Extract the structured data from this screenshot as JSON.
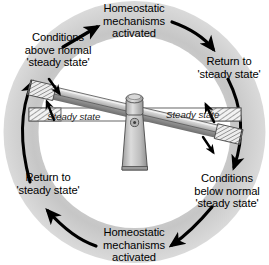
{
  "diagram": {
    "cycle_labels": [
      {
        "id": "homeostatic-top",
        "lines": [
          "Homeostatic",
          "mechanisms",
          "activated"
        ]
      },
      {
        "id": "conditions-above",
        "lines": [
          "Conditions",
          "above normal",
          "'steady state'"
        ]
      },
      {
        "id": "return-upper",
        "lines": [
          "Return to",
          "'steady state'"
        ]
      },
      {
        "id": "conditions-below",
        "lines": [
          "Conditions",
          "below normal",
          "'steady state'"
        ]
      },
      {
        "id": "return-lower",
        "lines": [
          "Return to",
          "'steady state'"
        ]
      },
      {
        "id": "homeostatic-bottom",
        "lines": [
          "Homeostatic",
          "mechanisms",
          "activated"
        ]
      }
    ],
    "seesaw": {
      "left_label": "Steady state",
      "right_label": "Steady state"
    },
    "colors": {
      "background": "#ffffff",
      "ring": "#c9c9c9",
      "ring_inner": "#ffffff",
      "arrow": "#000000",
      "beam_light": "#e2e2e2",
      "beam_mid": "#b9b9b9",
      "beam_dark": "#8e8e8e",
      "outline": "#3a3a3a",
      "text": "#000000"
    }
  }
}
